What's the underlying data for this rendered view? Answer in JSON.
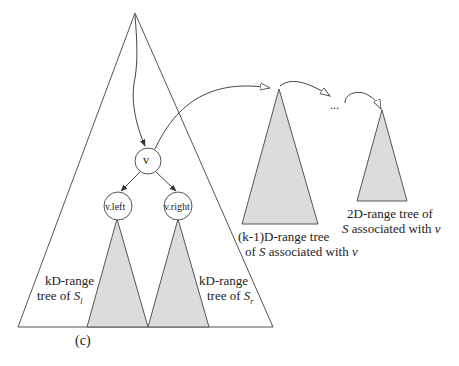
{
  "diagram": {
    "caption": "(c)",
    "nodes": {
      "v": "v",
      "v_left": "v.left",
      "v_right": "v.right"
    },
    "labels": {
      "left_subtree_line1": "kD-range",
      "left_subtree_line2_prefix": "tree of ",
      "left_subtree_set": "S",
      "left_subtree_sub": "l",
      "right_subtree_line1": "kD-range",
      "right_subtree_line2_prefix": "tree of ",
      "right_subtree_set": "S",
      "right_subtree_sub": "r",
      "assoc_k1_line1": "(k-1)D-range tree",
      "assoc_k1_line2_prefix": "of ",
      "assoc_k1_set": "S",
      "assoc_k1_line2_mid": " associated with ",
      "assoc_k1_var": "v",
      "assoc_2d_line1": "2D-range tree of",
      "assoc_2d_set": "S",
      "assoc_2d_line2_mid": " associated with ",
      "assoc_2d_var": "v",
      "ellipsis": "..."
    },
    "colors": {
      "stroke": "#555555",
      "fill_gray": "#dcdcdc",
      "text": "#222222"
    }
  }
}
